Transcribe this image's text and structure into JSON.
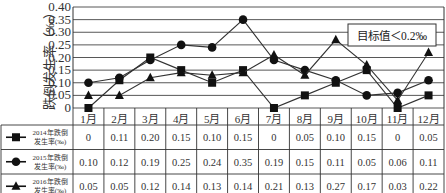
{
  "chart_data": {
    "type": "line",
    "title": "",
    "ylabel": "跌倒发生率（‰）",
    "xlabel": "",
    "ylim": [
      0,
      0.4
    ],
    "yticks": [
      "0",
      "0.05",
      "0.10",
      "0.15",
      "0.20",
      "0.25",
      "0.30",
      "0.35",
      "0.40"
    ],
    "grid": true,
    "categories": [
      "1月",
      "2月",
      "3月",
      "4月",
      "5月",
      "6月",
      "7月",
      "8月",
      "9月",
      "10月",
      "11月",
      "12月"
    ],
    "series": [
      {
        "name": "2014年跌倒发生率(‰)",
        "name_line1": "2014年跌倒",
        "name_line2": "发生率(‰)",
        "marker": "square",
        "values": [
          0,
          0.11,
          0.2,
          0.15,
          0.1,
          0.15,
          0,
          0.05,
          0.1,
          0.15,
          0,
          0.05
        ],
        "labels": [
          "0",
          "0.11",
          "0.20",
          "0.15",
          "0.10",
          "0.15",
          "0",
          "0.05",
          "0.10",
          "0.15",
          "0",
          "0.05"
        ]
      },
      {
        "name": "2015年跌倒发生率(‰)",
        "name_line1": "2015年跌倒",
        "name_line2": "发生率(‰)",
        "marker": "circle",
        "values": [
          0.1,
          0.12,
          0.19,
          0.25,
          0.24,
          0.35,
          0.19,
          0.15,
          0.11,
          0.05,
          0.06,
          0.11
        ],
        "labels": [
          "0.10",
          "0.12",
          "0.19",
          "0.25",
          "0.24",
          "0.35",
          "0.19",
          "0.15",
          "0.11",
          "0.05",
          "0.06",
          "0.11"
        ]
      },
      {
        "name": "2016年跌倒发生率(‰)",
        "name_line1": "2016年跌倒",
        "name_line2": "发生率(‰)",
        "marker": "triangle",
        "values": [
          0.05,
          0.05,
          0.12,
          0.14,
          0.13,
          0.14,
          0.21,
          0.13,
          0.27,
          0.17,
          0.03,
          0.22
        ],
        "labels": [
          "0.05",
          "0.05",
          "0.12",
          "0.14",
          "0.13",
          "0.14",
          "0.21",
          "0.13",
          "0.27",
          "0.17",
          "0.03",
          "0.22"
        ]
      }
    ],
    "annotations": [
      "目标值＜0.2‰"
    ],
    "legend_position": "table-left"
  }
}
